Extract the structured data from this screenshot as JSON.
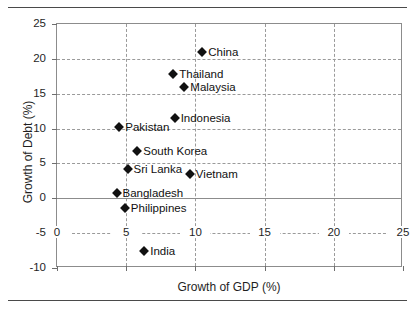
{
  "chart_data": {
    "type": "scatter",
    "title": "",
    "xlabel": "Growth of GDP (%)",
    "ylabel": "Growth of Debt (%)",
    "xlim": [
      0,
      25
    ],
    "ylim": [
      -10,
      25
    ],
    "xticks": [
      0,
      5,
      10,
      15,
      20,
      25
    ],
    "yticks": [
      -10,
      -5,
      0,
      5,
      10,
      15,
      20,
      25
    ],
    "xtick_labels": [
      "0",
      "5",
      "10",
      "15",
      "20",
      "25"
    ],
    "ytick_labels": [
      "-10",
      "-5",
      "0",
      "5",
      "10",
      "15",
      "20",
      "25"
    ],
    "grid": true,
    "grid_style": "dashed",
    "zero_line": true,
    "legend": "none",
    "marker": "diamond",
    "marker_color": "#111111",
    "points": [
      {
        "label": "China",
        "x": 10.5,
        "y": 21.0,
        "label_side": "right"
      },
      {
        "label": "Thailand",
        "x": 8.4,
        "y": 17.8,
        "label_side": "right"
      },
      {
        "label": "Malaysia",
        "x": 9.2,
        "y": 15.9,
        "label_side": "right"
      },
      {
        "label": "Indonesia",
        "x": 8.5,
        "y": 11.5,
        "label_side": "right"
      },
      {
        "label": "Pakistan",
        "x": 4.5,
        "y": 10.2,
        "label_side": "right"
      },
      {
        "label": "South Korea",
        "x": 5.8,
        "y": 6.8,
        "label_side": "right"
      },
      {
        "label": "Sri Lanka",
        "x": 5.1,
        "y": 4.2,
        "label_side": "right"
      },
      {
        "label": "Vietnam",
        "x": 9.6,
        "y": 3.5,
        "label_side": "right"
      },
      {
        "label": "Bangladesh",
        "x": 4.3,
        "y": 0.8,
        "label_side": "right"
      },
      {
        "label": "Philippines",
        "x": 4.9,
        "y": -1.4,
        "label_side": "right"
      },
      {
        "label": "India",
        "x": 6.3,
        "y": -7.6,
        "label_side": "right"
      }
    ]
  }
}
